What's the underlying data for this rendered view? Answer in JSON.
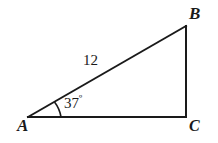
{
  "figure": {
    "type": "right-triangle-diagram",
    "background_color": "#ffffff",
    "stroke_color": "#1a1a1a",
    "vertices": {
      "a": {
        "label": "A",
        "x": 28,
        "y": 117
      },
      "b": {
        "label": "B",
        "x": 186,
        "y": 26
      },
      "c": {
        "label": "C",
        "x": 186,
        "y": 117
      }
    },
    "sides": {
      "hypotenuse_label": "12",
      "base_label": "",
      "vertical_label": ""
    },
    "angles": {
      "at_a_value": "37",
      "at_a_degree_symbol": "º",
      "at_a_full": "37º"
    }
  }
}
